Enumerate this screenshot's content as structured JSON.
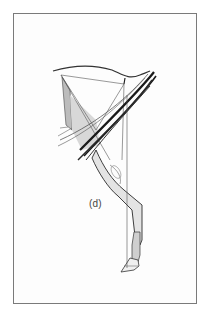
{
  "figure": {
    "panel_label": "(d)",
    "colors": {
      "border": "#7a7a7a",
      "ink": "#222222",
      "shade": "#9a9a9a",
      "background": "#ffffff"
    }
  }
}
